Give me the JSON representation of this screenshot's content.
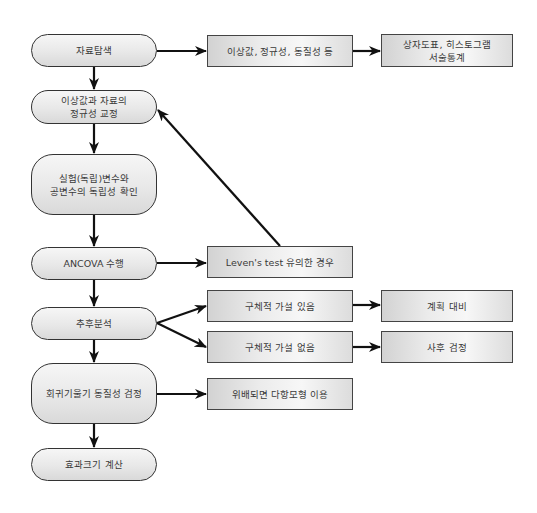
{
  "diagram": {
    "type": "flowchart",
    "colors": {
      "line": "#111111",
      "node_border": "#333333",
      "node_fill": "#e8e8e8",
      "text": "#3a3a3a"
    },
    "main_flow": [
      {
        "id": "n1",
        "label": "자료탐색"
      },
      {
        "id": "n2",
        "label": "이상값과 자료의\n정규성 교정"
      },
      {
        "id": "n3",
        "label": "실험(독립)변수와\n공변수의 독립성 확인"
      },
      {
        "id": "n4",
        "label": "ANCOVA 수행"
      },
      {
        "id": "n5",
        "label": "추후분석"
      },
      {
        "id": "n6",
        "label": "회귀기울기 동질성 검정"
      },
      {
        "id": "n7",
        "label": "효과크기 계산"
      }
    ],
    "side_boxes": [
      {
        "id": "b1",
        "label": "이상값, 정규성, 동질성 등"
      },
      {
        "id": "b2",
        "label": "상자도표, 히스토그램\n서술통계"
      },
      {
        "id": "b3",
        "label": "Leven's test 유의한 경우"
      },
      {
        "id": "b4",
        "label": "구체적 가설 있음"
      },
      {
        "id": "b5",
        "label": "계획 대비"
      },
      {
        "id": "b6",
        "label": "구체적 가설 없음"
      },
      {
        "id": "b7",
        "label": "사후 검정"
      },
      {
        "id": "b8",
        "label": "위배되면 다항모형 이용"
      }
    ],
    "edges": [
      [
        "n1",
        "n2"
      ],
      [
        "n2",
        "n3"
      ],
      [
        "n3",
        "n4"
      ],
      [
        "n4",
        "n5"
      ],
      [
        "n5",
        "n6"
      ],
      [
        "n6",
        "n7"
      ],
      [
        "n1",
        "b1"
      ],
      [
        "b1",
        "b2"
      ],
      [
        "n4",
        "b3"
      ],
      [
        "b3",
        "n2"
      ],
      [
        "n5",
        "b4"
      ],
      [
        "n5",
        "b6"
      ],
      [
        "b4",
        "b5"
      ],
      [
        "b6",
        "b7"
      ],
      [
        "n6",
        "b8"
      ]
    ]
  }
}
